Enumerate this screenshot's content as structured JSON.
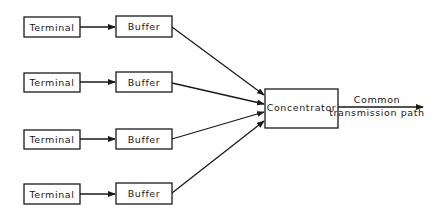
{
  "diagram": {
    "type": "block-diagram",
    "rows": [
      {
        "terminal": "Terminal",
        "buffer": "Buffer"
      },
      {
        "terminal": "Terminal",
        "buffer": "Buffer"
      },
      {
        "terminal": "Terminal",
        "buffer": "Buffer"
      },
      {
        "terminal": "Terminal",
        "buffer": "Buffer"
      }
    ],
    "concentrator": "Concentrator",
    "output_label": {
      "line1": "Common",
      "line2": "transmission path"
    },
    "colors": {
      "stroke": "#1a1a1a",
      "background": "#ffffff"
    }
  }
}
